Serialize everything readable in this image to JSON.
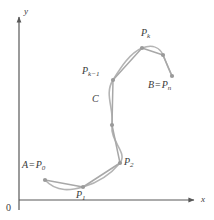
{
  "figure": {
    "background_color": "#ffffff",
    "curve_color": "#b4b4b4",
    "chord_color": "#a8a8a8",
    "point_color": "#9a9a9a",
    "axis_color": "#585858",
    "label_color": "#3a3a3a"
  },
  "axes": {
    "x_label": "x",
    "y_label": "y",
    "origin_label": "0",
    "x_axis": {
      "x1": 19,
      "y1": 200,
      "x2": 196,
      "y2": 200
    },
    "y_axis": {
      "x1": 19,
      "y1": 200,
      "x2": 19,
      "y2": 15
    },
    "x_label_pos": {
      "x": 201,
      "y": 197
    },
    "y_label_pos": {
      "x": 24,
      "y": 8
    },
    "origin_label_pos": {
      "x": 6,
      "y": 204
    }
  },
  "curve": {
    "name": "C",
    "label": "C",
    "label_pos": {
      "x": 92,
      "y": 95
    },
    "path": "M 45,180 C 57,193 72,190 83,187 C 97,183 110,175 120,163 C 128,152 110,142 112,125 C 114,108 104,94 113,80 C 121,67 130,53 142,48 C 153,44 160,48 163,55 C 166,62 169,70 172,76"
  },
  "chords": [
    {
      "from": "P0",
      "to": "P1",
      "x1": 45,
      "y1": 180,
      "x2": 83,
      "y2": 187
    },
    {
      "from": "P1",
      "to": "P2",
      "x1": 83,
      "y1": 187,
      "x2": 120,
      "y2": 163
    },
    {
      "from": "P2",
      "to": "mid1",
      "x1": 120,
      "y1": 163,
      "x2": 112,
      "y2": 125
    },
    {
      "from": "mid1",
      "to": "Pk-1",
      "x1": 112,
      "y1": 125,
      "x2": 113,
      "y2": 80
    },
    {
      "from": "Pk-1",
      "to": "Pk",
      "x1": 113,
      "y1": 80,
      "x2": 142,
      "y2": 48
    },
    {
      "from": "Pk",
      "to": "mid2",
      "x1": 142,
      "y1": 48,
      "x2": 163,
      "y2": 55
    },
    {
      "from": "mid2",
      "to": "Pn",
      "x1": 163,
      "y1": 55,
      "x2": 172,
      "y2": 76
    }
  ],
  "points": [
    {
      "id": "P0",
      "label_html": "A = P<sub>0</sub>",
      "label_main": "A",
      "label_eq": "=",
      "label_p": "P",
      "label_sub": "0",
      "x": 45,
      "y": 180,
      "label_x": 22,
      "label_y": 160
    },
    {
      "id": "P1",
      "label_html": "P<sub>1</sub>",
      "label_p": "P",
      "label_sub": "1",
      "x": 83,
      "y": 187,
      "label_x": 76,
      "label_y": 191
    },
    {
      "id": "P2",
      "label_html": "P<sub>2</sub>",
      "label_p": "P",
      "label_sub": "2",
      "x": 120,
      "y": 163,
      "label_x": 124,
      "label_y": 158
    },
    {
      "id": "mid1",
      "label_html": "",
      "x": 112,
      "y": 125,
      "label_x": 0,
      "label_y": 0
    },
    {
      "id": "Pk-1",
      "label_html": "P<sub>k-1</sub>",
      "label_p": "P",
      "label_sub": "k−1",
      "x": 113,
      "y": 80,
      "label_x": 82,
      "label_y": 67
    },
    {
      "id": "Pk",
      "label_html": "P<sub>k</sub>",
      "label_p": "P",
      "label_sub": "k",
      "x": 142,
      "y": 48,
      "label_x": 141,
      "label_y": 29
    },
    {
      "id": "mid2",
      "label_html": "",
      "x": 163,
      "y": 55,
      "label_x": 0,
      "label_y": 0
    },
    {
      "id": "Pn",
      "label_html": "B = P<sub>n</sub>",
      "label_main": "B",
      "label_eq": "=",
      "label_p": "P",
      "label_sub": "n",
      "x": 172,
      "y": 76,
      "label_x": 148,
      "label_y": 81
    }
  ]
}
